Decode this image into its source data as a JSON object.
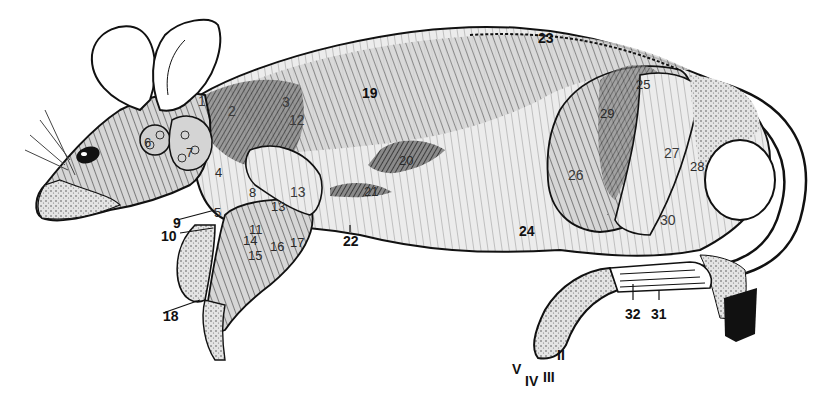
{
  "figure": {
    "colors": {
      "ink": "#111111",
      "shade": "#555555",
      "muscle": "#bdbdbd",
      "paper": "#ffffff",
      "highlight": "#e8e8e8"
    },
    "labels": [
      {
        "id": "1",
        "text": "1",
        "x": 198,
        "y": 94,
        "cls": "light"
      },
      {
        "id": "2",
        "text": "2",
        "x": 228,
        "y": 104,
        "cls": "light"
      },
      {
        "id": "3",
        "text": "3",
        "x": 282,
        "y": 95,
        "cls": "light"
      },
      {
        "id": "4",
        "text": "4",
        "x": 215,
        "y": 166,
        "cls": "faint"
      },
      {
        "id": "5",
        "text": "5",
        "x": 214,
        "y": 206,
        "cls": "faint"
      },
      {
        "id": "6",
        "text": "6",
        "x": 144,
        "y": 136,
        "cls": "faint"
      },
      {
        "id": "7",
        "text": "7",
        "x": 186,
        "y": 146,
        "cls": "faint"
      },
      {
        "id": "8",
        "text": "8",
        "x": 249,
        "y": 186,
        "cls": "faint"
      },
      {
        "id": "9",
        "text": "9",
        "x": 173,
        "y": 216,
        "cls": ""
      },
      {
        "id": "10",
        "text": "10",
        "x": 161,
        "y": 229,
        "cls": ""
      },
      {
        "id": "11",
        "text": "11",
        "x": 249,
        "y": 223,
        "cls": "faint"
      },
      {
        "id": "12",
        "text": "12",
        "x": 289,
        "y": 113,
        "cls": "light"
      },
      {
        "id": "13a",
        "text": "13",
        "x": 290,
        "y": 185,
        "cls": "light"
      },
      {
        "id": "13b",
        "text": "13",
        "x": 271,
        "y": 200,
        "cls": "faint"
      },
      {
        "id": "14",
        "text": "14",
        "x": 243,
        "y": 234,
        "cls": "faint"
      },
      {
        "id": "15",
        "text": "15",
        "x": 248,
        "y": 249,
        "cls": "faint"
      },
      {
        "id": "16",
        "text": "16",
        "x": 270,
        "y": 240,
        "cls": "faint"
      },
      {
        "id": "17",
        "text": "17",
        "x": 290,
        "y": 236,
        "cls": "faint"
      },
      {
        "id": "18",
        "text": "18",
        "x": 163,
        "y": 309,
        "cls": ""
      },
      {
        "id": "19",
        "text": "19",
        "x": 362,
        "y": 86,
        "cls": ""
      },
      {
        "id": "20",
        "text": "20",
        "x": 399,
        "y": 154,
        "cls": "faint"
      },
      {
        "id": "21",
        "text": "21",
        "x": 364,
        "y": 185,
        "cls": "faint"
      },
      {
        "id": "22",
        "text": "22",
        "x": 343,
        "y": 234,
        "cls": ""
      },
      {
        "id": "23",
        "text": "23",
        "x": 538,
        "y": 31,
        "cls": ""
      },
      {
        "id": "24",
        "text": "24",
        "x": 519,
        "y": 224,
        "cls": ""
      },
      {
        "id": "25",
        "text": "25",
        "x": 636,
        "y": 78,
        "cls": "faint"
      },
      {
        "id": "26",
        "text": "26",
        "x": 568,
        "y": 168,
        "cls": "light"
      },
      {
        "id": "27",
        "text": "27",
        "x": 664,
        "y": 146,
        "cls": "light"
      },
      {
        "id": "28",
        "text": "28",
        "x": 690,
        "y": 160,
        "cls": "faint"
      },
      {
        "id": "29",
        "text": "29",
        "x": 600,
        "y": 107,
        "cls": "faint"
      },
      {
        "id": "30",
        "text": "30",
        "x": 660,
        "y": 213,
        "cls": "light"
      },
      {
        "id": "31",
        "text": "31",
        "x": 651,
        "y": 307,
        "cls": ""
      },
      {
        "id": "32",
        "text": "32",
        "x": 625,
        "y": 307,
        "cls": ""
      },
      {
        "id": "II",
        "text": "II",
        "x": 557,
        "y": 348,
        "cls": ""
      },
      {
        "id": "III",
        "text": "III",
        "x": 543,
        "y": 370,
        "cls": ""
      },
      {
        "id": "IV",
        "text": "IV",
        "x": 525,
        "y": 374,
        "cls": ""
      },
      {
        "id": "V",
        "text": "V",
        "x": 512,
        "y": 362,
        "cls": ""
      }
    ]
  }
}
